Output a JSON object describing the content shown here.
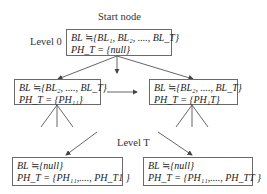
{
  "diagram": {
    "start_label": "Start node",
    "level0_label": "Level 0",
    "levelT_label": "Level T",
    "nodes": {
      "root": {
        "bl": "BL ≒{BL₁, BL₂, ...., BL_T}",
        "ph": "PH_T = {null}"
      },
      "mid_left": {
        "bl": "BL ≒{BL₂, ...., BL_T}",
        "ph": "PH_T = {PH₁₁}"
      },
      "mid_right": {
        "bl": "BL ≒{BL₂, ...., BL_T}",
        "ph": "PH_T = {PH₁T}"
      },
      "leaf_left": {
        "bl": "BL ≒{null}",
        "ph": "PH_T = {PH₁₁,...., PH_T1 }"
      },
      "leaf_right": {
        "bl": "BL ≒{null}",
        "ph": "PH_T = {PH₁₁,...., PH_TT }"
      }
    },
    "colors": {
      "line": "#555555",
      "border": "#6a6a6a",
      "text": "#222222"
    }
  }
}
